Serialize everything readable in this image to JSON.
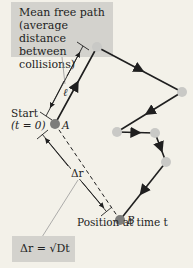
{
  "callouts": {
    "mean_free_path": [
      "Mean free path",
      "(average distance",
      "between collisions)"
    ],
    "formula": "Δr = √Dt"
  },
  "labels": {
    "start": "Start",
    "start_time": "(t = 0)",
    "point_a": "A",
    "point_b": "B",
    "ell": "ℓ",
    "delta_r": "Δr",
    "end_position": "Position at time t"
  },
  "path": {
    "nodes": [
      {
        "id": "A",
        "x": 55,
        "y": 124
      },
      {
        "id": "n1",
        "x": 97,
        "y": 47
      },
      {
        "id": "n2",
        "x": 182,
        "y": 92
      },
      {
        "id": "n3",
        "x": 117,
        "y": 132
      },
      {
        "id": "n4",
        "x": 155,
        "y": 133
      },
      {
        "id": "n5",
        "x": 166,
        "y": 162
      },
      {
        "id": "B",
        "x": 120,
        "y": 220
      }
    ]
  },
  "colors": {
    "background": "#f3f1e9",
    "box": "#d3d2cd",
    "node": "#c9c9c6",
    "endpoint": "#7d7d7b",
    "line": "#1f1f1f"
  }
}
